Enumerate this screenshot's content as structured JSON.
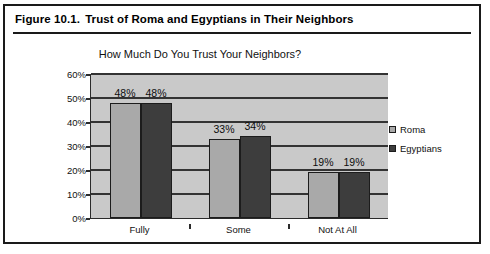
{
  "figure": {
    "number": "Figure 10.1.",
    "caption": "Trust of Roma and Egyptians in Their Neighbors"
  },
  "legend": {
    "position": "right",
    "entries": [
      {
        "label": "Roma",
        "color": "#a9a9a9"
      },
      {
        "label": "Egyptians",
        "color": "#3d3d3d"
      }
    ]
  },
  "axis": {
    "y_ticks": [
      "0%",
      "10%",
      "20%",
      "30%",
      "40%",
      "50%",
      "60%"
    ],
    "x_ticks": [
      "Fully",
      "Some",
      "Not At All"
    ]
  },
  "bar_labels": {
    "fully_roma": "48%",
    "fully_egyptians": "48%",
    "some_roma": "33%",
    "some_egyptians": "34%",
    "notatall_roma": "19%",
    "notatall_egyptians": "19%"
  },
  "chart_data": {
    "type": "bar",
    "title": "How Much Do You Trust Your Neighbors?",
    "xlabel": "",
    "ylabel": "",
    "categories": [
      "Fully",
      "Some",
      "Not At All"
    ],
    "series": [
      {
        "name": "Roma",
        "color": "#a9a9a9",
        "values": [
          48,
          33,
          19
        ]
      },
      {
        "name": "Egyptians",
        "color": "#3d3d3d",
        "values": [
          48,
          34,
          19
        ]
      }
    ],
    "value_labels": [
      [
        "48%",
        "33%",
        "19%"
      ],
      [
        "48%",
        "34%",
        "19%"
      ]
    ],
    "ylim": [
      0,
      60
    ],
    "ytick_interval": 10,
    "ytick_format": "percent",
    "grid": "horizontal",
    "legend_position": "right",
    "plot_background": "#c9c9c9"
  }
}
